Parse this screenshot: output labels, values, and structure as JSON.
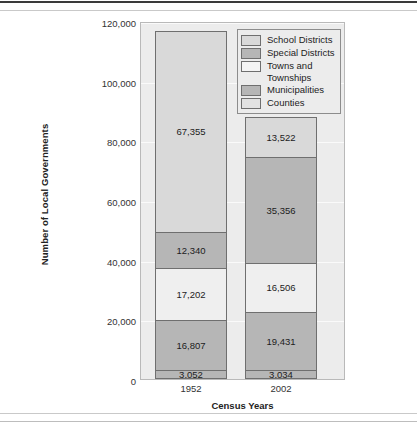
{
  "chart_data": {
    "type": "bar",
    "subtype": "stacked",
    "title": "",
    "xlabel": "Census Years",
    "ylabel": "Number of Local Governments",
    "categories": [
      "1952",
      "2002"
    ],
    "ylim": [
      0,
      120000
    ],
    "yticks": [
      0,
      20000,
      40000,
      60000,
      80000,
      100000,
      120000
    ],
    "ytick_labels": [
      "0",
      "20,000",
      "40,000",
      "60,000",
      "80,000",
      "100,000",
      "120,000"
    ],
    "grid": true,
    "legend_position": "top-right",
    "stack_order_bottom_to_top": [
      "Counties",
      "Municipalities",
      "Towns and Townships",
      "Special Districts",
      "School Districts"
    ],
    "series": [
      {
        "name": "Counties",
        "color": "#b6b6b6",
        "values": [
          3052,
          3034
        ],
        "labels": [
          "3,052",
          "3,034"
        ]
      },
      {
        "name": "Municipalities",
        "color": "#b6b6b6",
        "values": [
          16807,
          19431
        ],
        "labels": [
          "16,807",
          "19,431"
        ]
      },
      {
        "name": "Towns and Townships",
        "color": "#efefef",
        "values": [
          17202,
          16506
        ],
        "labels": [
          "17,202",
          "16,506"
        ]
      },
      {
        "name": "Special Districts",
        "color": "#b6b6b6",
        "values": [
          12340,
          35356
        ],
        "labels": [
          "12,340",
          "35,356"
        ]
      },
      {
        "name": "School Districts",
        "color": "#d9d9d9",
        "values": [
          67355,
          13522
        ],
        "labels": [
          "67,355",
          "13,522"
        ]
      }
    ],
    "totals": [
      116756,
      87849
    ]
  },
  "legend": {
    "items": [
      {
        "label": "School Districts",
        "color": "#d9d9d9"
      },
      {
        "label": "Special Districts",
        "color": "#b6b6b6"
      },
      {
        "label": "Towns and Townships",
        "color": "#f4f4f4"
      },
      {
        "label": "Municipalities",
        "color": "#b6b6b6"
      },
      {
        "label": "Counties",
        "color": "#e2e2e2"
      }
    ]
  },
  "axis": {
    "y_title": "Number of Local Governments",
    "x_title": "Census Years",
    "y_ticks": [
      "120,000",
      "100,000",
      "80,000",
      "60,000",
      "40,000",
      "20,000",
      "0"
    ],
    "x_ticks": [
      "1952",
      "2002"
    ]
  },
  "colors": {
    "plot_background": "#ececec",
    "segment_border": "#6f6f6f",
    "text": "#1c1c1c"
  }
}
